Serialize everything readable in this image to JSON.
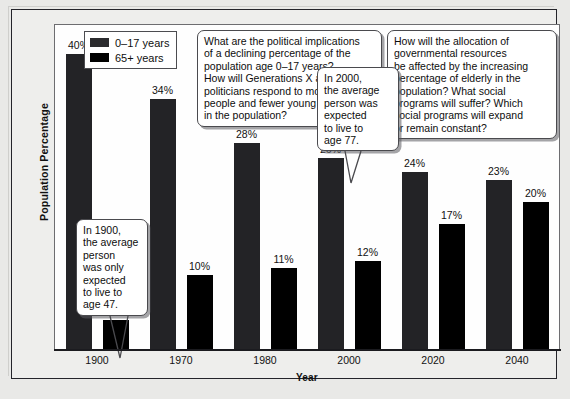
{
  "chart_data": {
    "type": "bar",
    "title": "",
    "xlabel": "Year",
    "ylabel": "Population Percentage",
    "categories": [
      "1900",
      "1970",
      "1980",
      "2000",
      "2020",
      "2040"
    ],
    "series": [
      {
        "name": "0–17 years",
        "values": [
          40,
          34,
          28,
          26,
          24,
          23
        ],
        "color": "#232326",
        "labels": [
          "40%",
          "34%",
          "28%",
          "26%",
          "24%",
          "23%"
        ]
      },
      {
        "name": "65+ years",
        "values": [
          4,
          10,
          11,
          12,
          17,
          20
        ],
        "color": "#000000",
        "labels": [
          "4%",
          "10%",
          "11%",
          "12%",
          "17%",
          "20%"
        ]
      }
    ],
    "ylim": [
      0,
      44
    ],
    "grid": false,
    "legend_position": "top-left",
    "value_suffix": "%"
  },
  "legend": {
    "items": [
      {
        "label": "0–17 years",
        "swatch": "s0"
      },
      {
        "label": "65+ years",
        "swatch": "s1"
      }
    ]
  },
  "axes": {
    "x_title": "Year",
    "y_title": "Population Percentage"
  },
  "callouts": [
    {
      "name": "callout-1900-life-expectancy",
      "text": "In 1900,\nthe average\nperson\nwas only\nexpected\nto live to\nage 47.",
      "lines": [
        "In 1900,",
        "the average",
        "person",
        "was only",
        "expected",
        "to live to",
        "age 47."
      ]
    },
    {
      "name": "callout-political-implications",
      "lines": [
        "What are the political implications",
        "of a declining percentage of the",
        "population age 0–17 years?",
        "How will Generations X and Y",
        "politicians respond to more elderly",
        "people and fewer young people",
        "in the population?"
      ]
    },
    {
      "name": "callout-resource-allocation",
      "lines": [
        "How will the allocation of",
        "governmental resources",
        "be affected by the increasing",
        "percentage of elderly in the",
        "population? What social",
        "programs will suffer? Which",
        "social programs will expand",
        "or remain constant?"
      ]
    },
    {
      "name": "callout-2000-life-expectancy",
      "lines": [
        "In 2000,",
        "the average",
        "person was",
        "expected",
        "to live to",
        "age 77."
      ]
    }
  ]
}
